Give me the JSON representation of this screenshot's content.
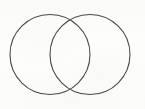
{
  "figure": {
    "kind": "venn-diagram",
    "title": "",
    "caption": "",
    "background_color": "#fdfdfc",
    "stroke_color": "#4a4a4a",
    "stroke_width": 1.1,
    "fill": "none",
    "canvas": {
      "width": 145,
      "height": 109
    },
    "sets": [
      {
        "id": "left-set",
        "label": "",
        "center_x": 50,
        "center_y": 54.5,
        "radius": 40,
        "stroke_color": "#4a4a4a"
      },
      {
        "id": "right-set",
        "label": "",
        "center_x": 90,
        "center_y": 54.5,
        "radius": 40,
        "stroke_color": "#4a4a4a"
      }
    ],
    "intersection": {
      "label": "",
      "top_point_x": 70,
      "top_point_y": 20,
      "bottom_point_x": 70,
      "bottom_point_y": 89
    },
    "region_labels": {
      "left_only": "",
      "overlap": "",
      "right_only": ""
    }
  }
}
